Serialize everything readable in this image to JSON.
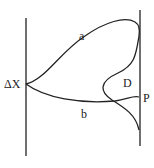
{
  "diagram": {
    "labels": {
      "left_point": "ΔX",
      "upper_curve": "a",
      "lower_curve": "b",
      "region": "D",
      "right_point": "P"
    },
    "colors": {
      "stroke": "#222222",
      "background": "#ffffff"
    }
  }
}
